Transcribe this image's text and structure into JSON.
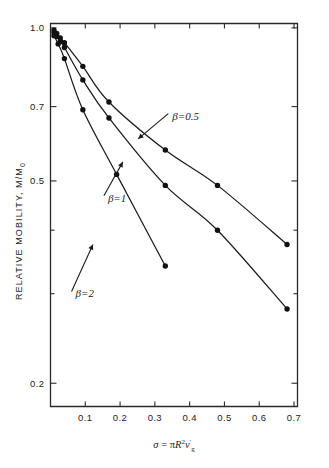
{
  "figure": {
    "background": "#ffffff",
    "ink_color": "#1c1c1c"
  },
  "chart_data": {
    "type": "line",
    "title": "",
    "xlabel": "σ = πR²ν'g",
    "xlabel_parts": {
      "sigma": "σ",
      "equals": "=",
      "pi": "π",
      "R": "R",
      "R_exp": "2",
      "nu": "ν",
      "nu_prime": "′",
      "nu_sub": "g"
    },
    "ylabel": "RELATIVE MOBILITY,  M/M",
    "ylabel_sub": "0",
    "yscale": "log",
    "xscale": "linear",
    "xlim": [
      0.0,
      0.71
    ],
    "ylim": [
      0.18,
      1.02
    ],
    "grid": false,
    "legend_position": "inline-annotations",
    "xticks": [
      0.1,
      0.2,
      0.3,
      0.4,
      0.5,
      0.6,
      0.7
    ],
    "xticklabels": [
      "0.1",
      "0.2",
      "0.3",
      "0.4",
      "0.5",
      "0.6",
      "0.7"
    ],
    "yticks": [
      1.0,
      0.7,
      0.5,
      0.4,
      0.3,
      0.2
    ],
    "yticklabels": [
      "1.0",
      "0.7",
      "0.5",
      "",
      "",
      "0.2"
    ],
    "ylabeled": [
      true,
      true,
      true,
      false,
      false,
      true
    ],
    "series": [
      {
        "name": "β = 0.5",
        "beta": 0.5,
        "annotation": "β=0.5",
        "points": [
          {
            "x": 0.01,
            "y": 0.99
          },
          {
            "x": 0.018,
            "y": 0.975
          },
          {
            "x": 0.028,
            "y": 0.955
          },
          {
            "x": 0.04,
            "y": 0.935
          },
          {
            "x": 0.093,
            "y": 0.84
          },
          {
            "x": 0.168,
            "y": 0.715
          },
          {
            "x": 0.33,
            "y": 0.575
          },
          {
            "x": 0.48,
            "y": 0.49
          },
          {
            "x": 0.68,
            "y": 0.375
          }
        ]
      },
      {
        "name": "β = 1",
        "beta": 1,
        "annotation": "β=1",
        "points": [
          {
            "x": 0.01,
            "y": 0.98
          },
          {
            "x": 0.018,
            "y": 0.962
          },
          {
            "x": 0.028,
            "y": 0.94
          },
          {
            "x": 0.04,
            "y": 0.915
          },
          {
            "x": 0.093,
            "y": 0.79
          },
          {
            "x": 0.168,
            "y": 0.665
          },
          {
            "x": 0.33,
            "y": 0.49
          },
          {
            "x": 0.48,
            "y": 0.4
          },
          {
            "x": 0.68,
            "y": 0.28
          }
        ]
      },
      {
        "name": "β = 2",
        "beta": 2,
        "annotation": "β=2",
        "points": [
          {
            "x": 0.01,
            "y": 0.965
          },
          {
            "x": 0.022,
            "y": 0.93
          },
          {
            "x": 0.04,
            "y": 0.87
          },
          {
            "x": 0.093,
            "y": 0.69
          },
          {
            "x": 0.19,
            "y": 0.515
          },
          {
            "x": 0.33,
            "y": 0.34
          }
        ]
      }
    ],
    "annotations": [
      {
        "label": "β=0.5",
        "x": 0.35,
        "y": 0.66,
        "arrow_to_x": 0.252,
        "arrow_to_y": 0.605
      },
      {
        "label": "β=1",
        "x": 0.165,
        "y": 0.455,
        "arrow_to_x": 0.208,
        "arrow_to_y": 0.545
      },
      {
        "label": "β=2",
        "x": 0.072,
        "y": 0.295,
        "arrow_to_x": 0.122,
        "arrow_to_y": 0.375
      }
    ]
  }
}
